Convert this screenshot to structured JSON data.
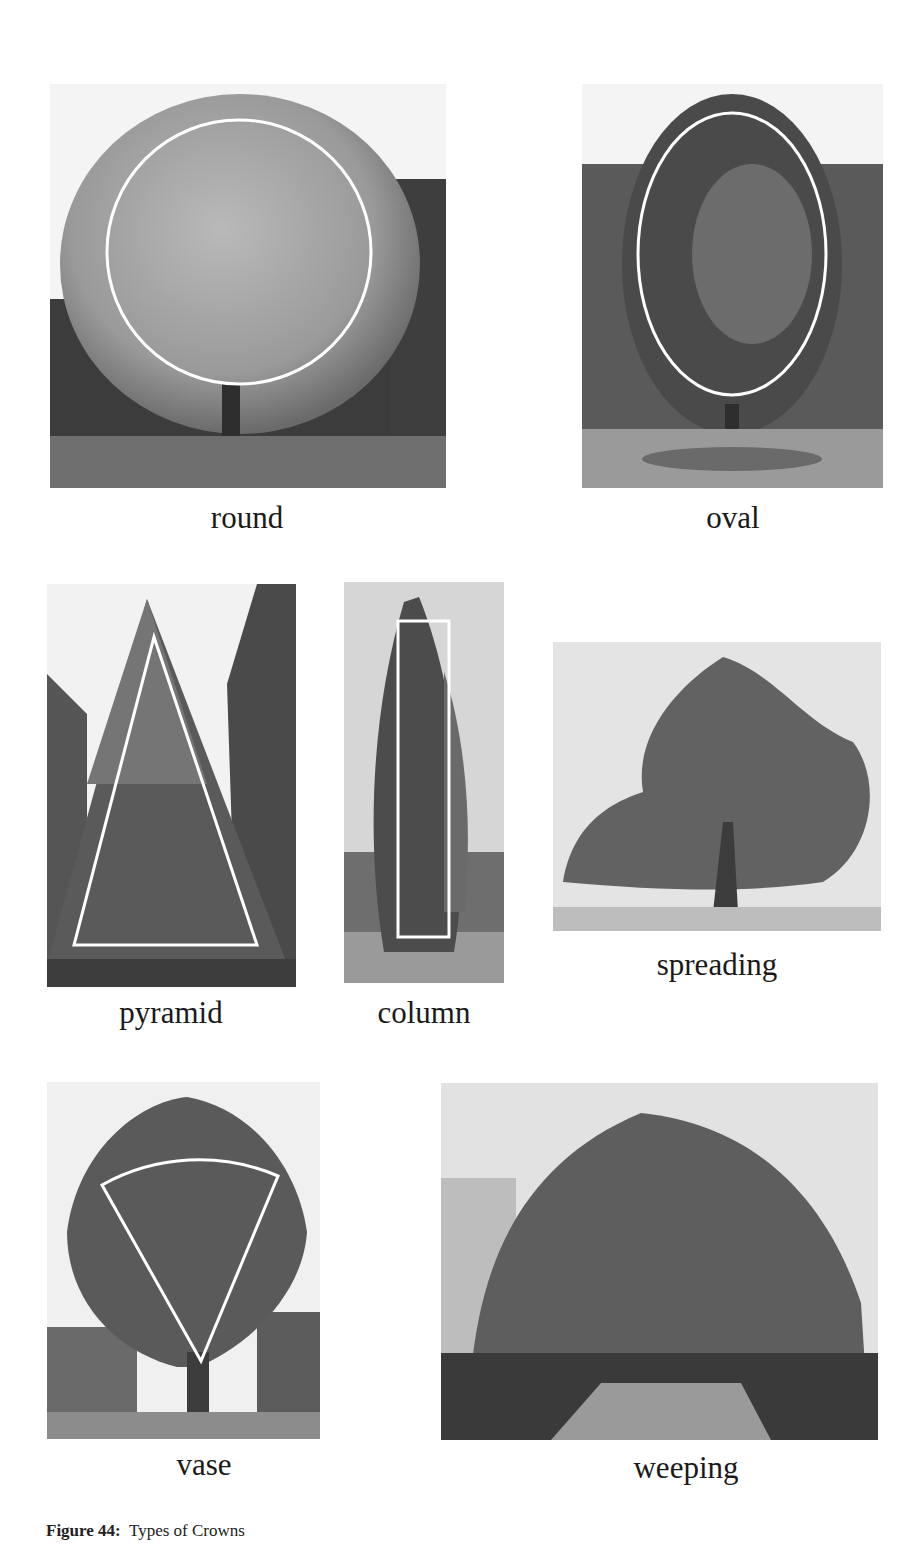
{
  "figure": {
    "number_label": "Figure 44:",
    "title": "Types of Crowns"
  },
  "panels": [
    {
      "id": "round",
      "label": "round",
      "overlay_shape": "circle"
    },
    {
      "id": "oval",
      "label": "oval",
      "overlay_shape": "ellipse"
    },
    {
      "id": "pyramid",
      "label": "pyramid",
      "overlay_shape": "triangle"
    },
    {
      "id": "column",
      "label": "column",
      "overlay_shape": "rectangle"
    },
    {
      "id": "spreading",
      "label": "spreading",
      "overlay_shape": "none"
    },
    {
      "id": "vase",
      "label": "vase",
      "overlay_shape": "sector"
    },
    {
      "id": "weeping",
      "label": "weeping",
      "overlay_shape": "none"
    }
  ],
  "colors": {
    "overlay_stroke": "#ffffff",
    "text": "#1a1a1a"
  }
}
